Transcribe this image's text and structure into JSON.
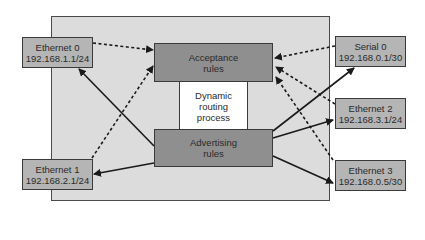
{
  "diagram": {
    "type": "router-routing-process",
    "center": {
      "acceptance": {
        "line1": "Acceptance",
        "line2": "rules"
      },
      "process": {
        "line1": "Dynamic",
        "line2": "routing",
        "line3": "process"
      },
      "advertising": {
        "line1": "Advertising",
        "line2": "rules"
      }
    },
    "interfaces": [
      {
        "id": "eth0",
        "name": "Ethernet 0",
        "address": "192.168.1.1/24",
        "side": "left"
      },
      {
        "id": "eth1",
        "name": "Ethernet 1",
        "address": "192.168.2.1/24",
        "side": "left"
      },
      {
        "id": "ser0",
        "name": "Serial 0",
        "address": "192.168.0.1/30",
        "side": "right"
      },
      {
        "id": "eth2",
        "name": "Ethernet 2",
        "address": "192.168.3.1/24",
        "side": "right"
      },
      {
        "id": "eth3",
        "name": "Ethernet 3",
        "address": "192.168.0.5/30",
        "side": "right"
      }
    ],
    "edges": [
      {
        "from": "eth0",
        "to": "acceptance",
        "style": "dashed"
      },
      {
        "from": "eth1",
        "to": "acceptance",
        "style": "dashed"
      },
      {
        "from": "ser0",
        "to": "acceptance",
        "style": "dashed"
      },
      {
        "from": "eth2",
        "to": "acceptance",
        "style": "dashed"
      },
      {
        "from": "eth3",
        "to": "acceptance",
        "style": "dashed"
      },
      {
        "from": "advertising",
        "to": "eth0",
        "style": "solid"
      },
      {
        "from": "advertising",
        "to": "eth1",
        "style": "solid"
      },
      {
        "from": "advertising",
        "to": "ser0",
        "style": "solid"
      },
      {
        "from": "advertising",
        "to": "eth2",
        "style": "solid"
      },
      {
        "from": "advertising",
        "to": "eth3",
        "style": "solid"
      }
    ],
    "colors": {
      "panel": "#dcdcdc",
      "interface_box": "#b5b5b5",
      "rules_box": "#8f8f8f",
      "process_box": "#ffffff",
      "line": "#1a1a1a"
    }
  }
}
